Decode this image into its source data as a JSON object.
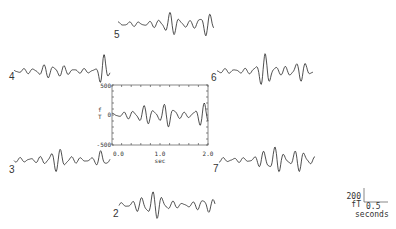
{
  "chart_data": {
    "type": "line",
    "title": "",
    "central_panel": {
      "xlabel": "sec",
      "ylabel": "fT",
      "xlim": [
        0.0,
        2.0
      ],
      "ylim": [
        -500,
        500
      ],
      "x_ticks": [
        "0.0",
        "1.0",
        "2.0"
      ],
      "y_ticks": [
        "500",
        "0",
        "-500"
      ]
    },
    "series": [
      {
        "name": "2",
        "position": "bottom"
      },
      {
        "name": "3",
        "position": "lower-left"
      },
      {
        "name": "4",
        "position": "upper-left"
      },
      {
        "name": "5",
        "position": "top"
      },
      {
        "name": "6",
        "position": "upper-right"
      },
      {
        "name": "7",
        "position": "lower-right"
      }
    ],
    "scale_bar": {
      "amplitude": "200",
      "amplitude_unit": "fT",
      "time": "0.5",
      "time_unit": "seconds"
    }
  },
  "labels": {
    "t2": "2",
    "t3": "3",
    "t4": "4",
    "t5": "5",
    "t6": "6",
    "t7": "7",
    "ytop": "500",
    "ymid": "0",
    "ybot": "-500",
    "x0": "0.0",
    "x1": "1.0",
    "x2": "2.0",
    "xunit": "sec",
    "yunit_f": "f",
    "yunit_t": "T",
    "sb_amp": "200",
    "sb_unit": "fT",
    "sb_time": "0.5",
    "sb_seconds": "seconds"
  }
}
